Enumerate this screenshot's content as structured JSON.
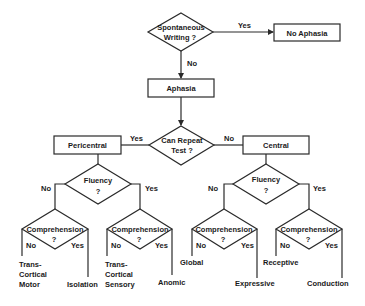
{
  "nodes": {
    "spontaneous": {
      "line1": "Spontaneous",
      "line2": "Writing  ?"
    },
    "no_aphasia": {
      "label": "No Aphasia"
    },
    "aphasia": {
      "label": "Aphasia"
    },
    "can_repeat": {
      "line1": "Can Repeat",
      "line2": "Test ?"
    },
    "pericentral": {
      "label": "Pericentral"
    },
    "central": {
      "label": "Central"
    },
    "fluency_left": {
      "line1": "Fluency",
      "line2": "?"
    },
    "fluency_right": {
      "line1": "Fluency",
      "line2": "?"
    },
    "comp1": {
      "line1": "Comprehension",
      "line2": "?"
    },
    "comp2": {
      "line1": "Comprehension",
      "line2": "?"
    },
    "comp3": {
      "line1": "Comprehension",
      "line2": "?"
    },
    "comp4": {
      "line1": "Comprehension",
      "line2": "?"
    }
  },
  "edges": {
    "yes": "Yes",
    "no": "No"
  },
  "outcomes": {
    "tcm": {
      "line1": "Trans-",
      "line2": "Cortical",
      "line3": "Motor"
    },
    "isolation": "Isolation",
    "tcs": {
      "line1": "Trans-",
      "line2": "Cortical",
      "line3": "Sensory"
    },
    "anomic": "Anomic",
    "global": "Global",
    "expressive": "Expressive",
    "receptive": "Receptive",
    "conduction": "Conduction"
  },
  "colors": {
    "stroke": "#2a2a2a",
    "text": "#1a1a1a",
    "background": "#ffffff"
  }
}
